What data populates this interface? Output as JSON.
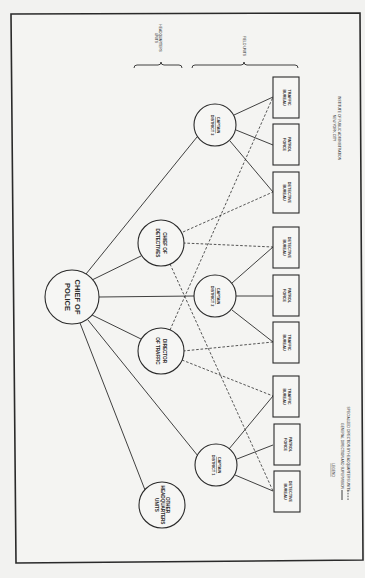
{
  "diagram": {
    "type": "organization-chart",
    "orientation": "rotated-90-clockwise",
    "root": {
      "id": "chief-of-police",
      "label_line1": "CHIEF OF",
      "label_line2": "POLICE"
    },
    "headquarters_units": [
      {
        "id": "chief-of-detectives",
        "label_line1": "CHIEF OF",
        "label_line2": "DETECTIVES"
      },
      {
        "id": "director-of-traffic",
        "label_line1": "DIRECTOR",
        "label_line2": "OF TRAFFIC"
      },
      {
        "id": "other-hq-units",
        "label_line1": "OTHER",
        "label_line2": "HEADQUARTERS",
        "label_line3": "UNITS"
      }
    ],
    "districts": [
      {
        "id": "district-3",
        "captain_label": "CAPTAIN",
        "district_label": "DISTRICT 3",
        "units": [
          {
            "line1": "TRAFFIC",
            "line2": "BUREAU"
          },
          {
            "line1": "PATROL",
            "line2": "FORCE"
          },
          {
            "line1": "DETECTIVE",
            "line2": "BUREAU"
          }
        ]
      },
      {
        "id": "district-2",
        "captain_label": "CAPTAIN",
        "district_label": "DISTRICT 2",
        "units": [
          {
            "line1": "DETECTIVE",
            "line2": "BUREAU"
          },
          {
            "line1": "PATROL",
            "line2": "FORCE"
          },
          {
            "line1": "TRAFFIC",
            "line2": "BUREAU"
          }
        ]
      },
      {
        "id": "district-1",
        "captain_label": "CAPTAIN",
        "district_label": "DISTRICT 1",
        "units": [
          {
            "line1": "TRAFFIC",
            "line2": "BUREAU"
          },
          {
            "line1": "PATROL",
            "line2": "FORCE"
          },
          {
            "line1": "DETECTIVE",
            "line2": "BUREAU"
          }
        ]
      }
    ],
    "section_labels": {
      "headquarters_line1": "HEADQUARTERS",
      "headquarters_line2": "UNITS",
      "field": "FIELD UNITS"
    },
    "credit": {
      "line1": "INSTITUTE OF PUBLIC ADMINISTRATION",
      "line2": "NEW YORK CITY"
    },
    "legend": {
      "title": "LEGEND",
      "solid_label": "GENERAL DIRECTION AND SUPERVISION",
      "dashed_label": "SPECIALIZED DIRECTION BY HEADQUARTERS UNITS"
    },
    "colors": {
      "ink": "#2a2a2a",
      "paper": "#f4f4f2"
    }
  }
}
